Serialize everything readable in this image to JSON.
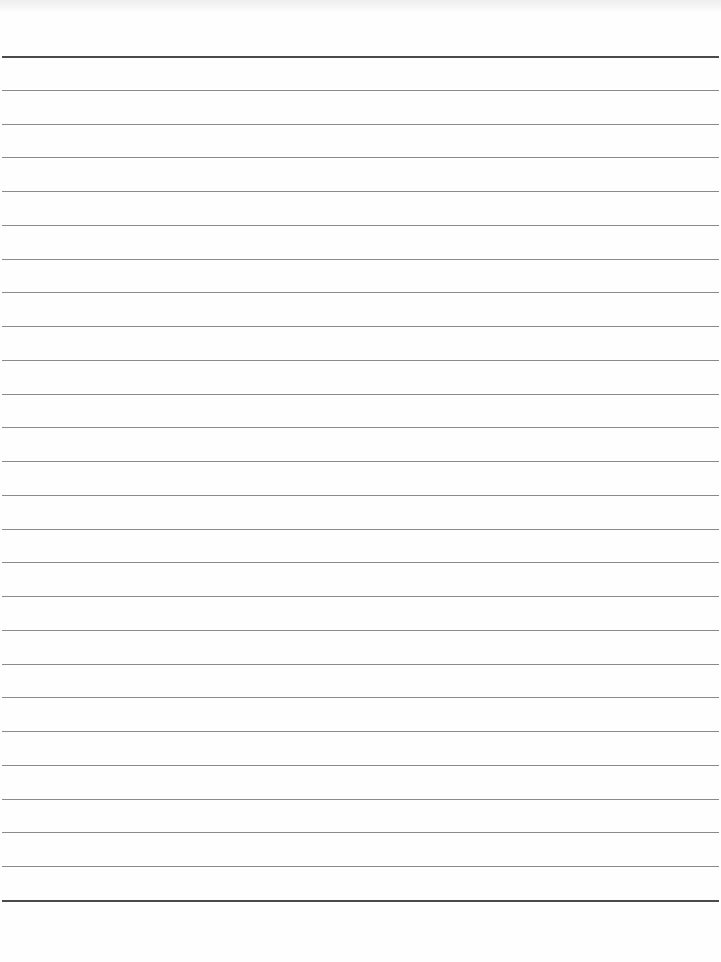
{
  "page": {
    "type": "blank ruled paper",
    "line_count": 26,
    "first_line_y": 56,
    "last_line_y": 900,
    "line_spacing": 33.76,
    "line_left": 2,
    "line_width": 717,
    "colors": {
      "paper": "#fefefe",
      "rule": "#8a8a8a",
      "rule_heavy": "#4a4a4a",
      "scan_edge": "#ececec"
    }
  }
}
